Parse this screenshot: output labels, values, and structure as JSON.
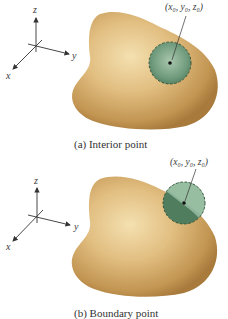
{
  "figure": {
    "panels": [
      {
        "id": "a",
        "caption": "(a) Interior point",
        "point_label": "(x₀, y₀, z₀)",
        "axes": {
          "x": "x",
          "y": "y",
          "z": "z"
        },
        "ball_position": "interior"
      },
      {
        "id": "b",
        "caption": "(b) Boundary point",
        "point_label": "(x₀, y₀, z₀)",
        "axes": {
          "x": "x",
          "y": "y",
          "z": "z"
        },
        "ball_position": "boundary"
      }
    ],
    "colors": {
      "solid_light": "#f1d9a4",
      "solid_dark": "#a87a3c",
      "ball_light": "#a9c7ae",
      "ball_dark": "#4f7d5e",
      "ball_border": "#2f4e38",
      "axis": "#333333"
    }
  }
}
